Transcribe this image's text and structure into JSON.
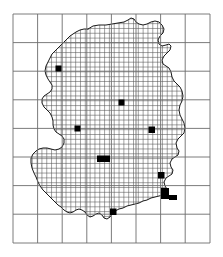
{
  "figure": {
    "kind": "dot-density-map",
    "width": 223,
    "height": 257,
    "background_color": "#ffffff"
  },
  "frame": {
    "name": "coarse-reference-grid",
    "x": 13,
    "y": 14,
    "width": 197,
    "height": 229,
    "columns": 8,
    "rows": 8,
    "line_color": "#6d6d6d",
    "line_width": 0.9,
    "col_x": [
      13,
      37.6,
      62.2,
      86.8,
      111.4,
      136.0,
      160.6,
      185.2,
      210
    ],
    "row_y": [
      14,
      42.6,
      71.2,
      99.8,
      128.4,
      157.0,
      185.6,
      214.2,
      243
    ]
  },
  "fine_grid": {
    "name": "sampling-grid",
    "cell_size": 4.82,
    "line_color": "#555555",
    "line_width": 0.55,
    "origin_x": 13,
    "origin_y": 14
  },
  "outline": {
    "name": "germany-border",
    "stroke_color": "#1a1a1a",
    "stroke_width": 1.0,
    "fill": "none",
    "points": [
      [
        88,
        29
      ],
      [
        93,
        26
      ],
      [
        99,
        25
      ],
      [
        106,
        25
      ],
      [
        112,
        24
      ],
      [
        118,
        23
      ],
      [
        124,
        22
      ],
      [
        128,
        20
      ],
      [
        131,
        18
      ],
      [
        134,
        19
      ],
      [
        136,
        22
      ],
      [
        139,
        24
      ],
      [
        143,
        25
      ],
      [
        147,
        24
      ],
      [
        151,
        22
      ],
      [
        155,
        21
      ],
      [
        159,
        22
      ],
      [
        162,
        25
      ],
      [
        164,
        29
      ],
      [
        163,
        33
      ],
      [
        160,
        36
      ],
      [
        158,
        40
      ],
      [
        159,
        44
      ],
      [
        162,
        46
      ],
      [
        166,
        45
      ],
      [
        169,
        44
      ],
      [
        171,
        46
      ],
      [
        170,
        50
      ],
      [
        167,
        53
      ],
      [
        164,
        56
      ],
      [
        162,
        60
      ],
      [
        163,
        64
      ],
      [
        166,
        66
      ],
      [
        169,
        68
      ],
      [
        171,
        72
      ],
      [
        172,
        77
      ],
      [
        174,
        81
      ],
      [
        177,
        84
      ],
      [
        180,
        87
      ],
      [
        182,
        91
      ],
      [
        183,
        96
      ],
      [
        182,
        101
      ],
      [
        180,
        105
      ],
      [
        179,
        110
      ],
      [
        180,
        115
      ],
      [
        182,
        119
      ],
      [
        184,
        123
      ],
      [
        185,
        128
      ],
      [
        184,
        133
      ],
      [
        181,
        136
      ],
      [
        178,
        139
      ],
      [
        176,
        143
      ],
      [
        177,
        148
      ],
      [
        179,
        151
      ],
      [
        178,
        155
      ],
      [
        175,
        157
      ],
      [
        172,
        159
      ],
      [
        170,
        163
      ],
      [
        171,
        167
      ],
      [
        173,
        170
      ],
      [
        172,
        174
      ],
      [
        169,
        176
      ],
      [
        166,
        178
      ],
      [
        164,
        182
      ],
      [
        165,
        186
      ],
      [
        167,
        189
      ],
      [
        166,
        193
      ],
      [
        163,
        195
      ],
      [
        159,
        196
      ],
      [
        155,
        197
      ],
      [
        151,
        198
      ],
      [
        147,
        200
      ],
      [
        143,
        201
      ],
      [
        139,
        203
      ],
      [
        135,
        204
      ],
      [
        131,
        205
      ],
      [
        127,
        206
      ],
      [
        123,
        208
      ],
      [
        119,
        209
      ],
      [
        115,
        211
      ],
      [
        112,
        214
      ],
      [
        110,
        217
      ],
      [
        107,
        219
      ],
      [
        104,
        218
      ],
      [
        102,
        215
      ],
      [
        99,
        213
      ],
      [
        96,
        214
      ],
      [
        93,
        216
      ],
      [
        90,
        217
      ],
      [
        87,
        215
      ],
      [
        85,
        212
      ],
      [
        82,
        210
      ],
      [
        79,
        209
      ],
      [
        76,
        210
      ],
      [
        73,
        212
      ],
      [
        70,
        213
      ],
      [
        67,
        212
      ],
      [
        64,
        210
      ],
      [
        61,
        207
      ],
      [
        58,
        205
      ],
      [
        55,
        202
      ],
      [
        52,
        199
      ],
      [
        49,
        196
      ],
      [
        46,
        193
      ],
      [
        43,
        190
      ],
      [
        40,
        186
      ],
      [
        38,
        182
      ],
      [
        36,
        177
      ],
      [
        34,
        173
      ],
      [
        32,
        168
      ],
      [
        31,
        163
      ],
      [
        31,
        158
      ],
      [
        33,
        154
      ],
      [
        36,
        151
      ],
      [
        39,
        149
      ],
      [
        43,
        148
      ],
      [
        47,
        148
      ],
      [
        51,
        149
      ],
      [
        55,
        150
      ],
      [
        59,
        149
      ],
      [
        62,
        147
      ],
      [
        64,
        143
      ],
      [
        64,
        139
      ],
      [
        62,
        136
      ],
      [
        59,
        134
      ],
      [
        56,
        132
      ],
      [
        54,
        129
      ],
      [
        53,
        125
      ],
      [
        53,
        121
      ],
      [
        52,
        117
      ],
      [
        50,
        113
      ],
      [
        47,
        110
      ],
      [
        44,
        107
      ],
      [
        42,
        103
      ],
      [
        42,
        99
      ],
      [
        44,
        96
      ],
      [
        47,
        94
      ],
      [
        50,
        92
      ],
      [
        52,
        89
      ],
      [
        52,
        85
      ],
      [
        50,
        82
      ],
      [
        48,
        79
      ],
      [
        46,
        75
      ],
      [
        45,
        71
      ],
      [
        46,
        66
      ],
      [
        48,
        62
      ],
      [
        50,
        58
      ],
      [
        52,
        54
      ],
      [
        55,
        51
      ],
      [
        58,
        48
      ],
      [
        61,
        45
      ],
      [
        64,
        42
      ],
      [
        67,
        39
      ],
      [
        70,
        36
      ],
      [
        73,
        34
      ],
      [
        76,
        32
      ],
      [
        80,
        30
      ],
      [
        84,
        29
      ],
      [
        88,
        29
      ]
    ]
  },
  "markers": {
    "name": "filled-sample-cells",
    "fill_color": "#000000",
    "items": [
      {
        "label": "marker-northwest",
        "x": 55.5,
        "y": 65.5,
        "w": 6.0,
        "h": 6.0
      },
      {
        "label": "marker-center",
        "x": 118.5,
        "y": 99.5,
        "w": 6.0,
        "h": 6.0
      },
      {
        "label": "marker-west",
        "x": 74.5,
        "y": 125.5,
        "w": 6.0,
        "h": 6.0
      },
      {
        "label": "marker-east",
        "x": 148.5,
        "y": 126.5,
        "w": 6.5,
        "h": 6.5
      },
      {
        "label": "marker-southcenter-wide",
        "x": 97.0,
        "y": 155.5,
        "w": 13.0,
        "h": 6.5
      },
      {
        "label": "marker-southeast",
        "x": 158.0,
        "y": 172.0,
        "w": 6.5,
        "h": 6.5
      },
      {
        "label": "marker-southeast-cluster-main",
        "x": 161.0,
        "y": 188.0,
        "w": 8.0,
        "h": 11.0
      },
      {
        "label": "marker-southeast-cluster-tail",
        "x": 169.0,
        "y": 195.0,
        "w": 8.0,
        "h": 5.0
      },
      {
        "label": "marker-south",
        "x": 110.0,
        "y": 208.5,
        "w": 6.5,
        "h": 6.5
      }
    ]
  }
}
